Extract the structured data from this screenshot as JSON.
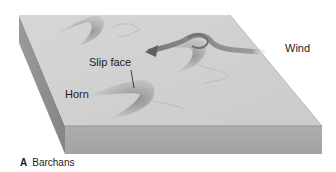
{
  "figure": {
    "caption_letter": "A",
    "caption_title": "Barchans",
    "labels": {
      "slip_face": "Slip face",
      "horn": "Horn",
      "wind": "Wind"
    },
    "colors": {
      "top_surface": "#cfcfcf",
      "front_face": "#a8a8a8",
      "side_face": "#8f8f8f",
      "dune_shadow": "#8c8c8c",
      "wind_arrow": "#6f6f6f",
      "text": "#1c1c1c"
    }
  }
}
